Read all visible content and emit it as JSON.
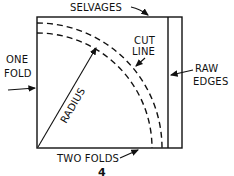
{
  "diagram": {
    "type": "fabric-folding-pattern",
    "labels": {
      "selvages": "SELVAGES",
      "one_fold_line1": "ONE",
      "one_fold_line2": "FOLD",
      "cut_line_line1": "CUT",
      "cut_line_line2": "LINE",
      "raw_edges_line1": "RAW",
      "raw_edges_line2": "EDGES",
      "radius": "RADIUS",
      "two_folds": "TWO FOLDS"
    },
    "figure_number": "4",
    "colors": {
      "ink": "#111111",
      "background": "#ffffff"
    }
  }
}
